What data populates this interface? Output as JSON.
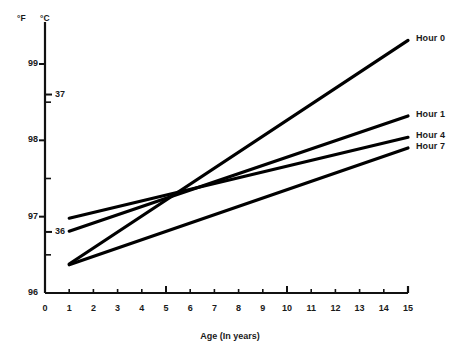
{
  "chart_data": {
    "type": "line",
    "title": "",
    "subtitle": "",
    "xlabel": "Age (In years)",
    "ylabel": "",
    "y_unit_primary": "°F",
    "y_unit_secondary": "°C",
    "xlim": [
      0,
      15
    ],
    "ylim": [
      96,
      99.6
    ],
    "grid": false,
    "legend_position": "right-inline",
    "x_ticks": [
      0,
      1,
      2,
      3,
      4,
      5,
      6,
      7,
      8,
      9,
      10,
      11,
      12,
      13,
      14,
      15
    ],
    "x_tick_labels": [
      "0",
      "1",
      "2",
      "3",
      "4",
      "5",
      "6",
      "7",
      "8",
      "9",
      "10",
      "11",
      "12",
      "13",
      "14",
      "15"
    ],
    "y_ticks_f_major": [
      96,
      97,
      98,
      99
    ],
    "y_tick_labels_f": [
      "96",
      "97",
      "98",
      "99"
    ],
    "y_ticks_f_minor": [
      96.5,
      97.5,
      98.5
    ],
    "y_ticks_c": [
      36,
      37
    ],
    "y_tick_labels_c": [
      "36",
      "37"
    ],
    "series": [
      {
        "name": "Hour 0",
        "label": "Hour 0",
        "x": [
          1,
          15
        ],
        "values": [
          96.38,
          99.31
        ],
        "color": "#000000"
      },
      {
        "name": "Hour 1",
        "label": "Hour 1",
        "x": [
          1,
          15
        ],
        "values": [
          96.81,
          98.32
        ],
        "color": "#000000"
      },
      {
        "name": "Hour 4",
        "label": "Hour 4",
        "x": [
          1,
          15
        ],
        "values": [
          96.98,
          98.04
        ],
        "color": "#000000"
      },
      {
        "name": "Hour 7",
        "label": "Hour 7",
        "x": [
          1,
          15
        ],
        "values": [
          96.37,
          97.9
        ],
        "color": "#000000"
      }
    ],
    "annotations": []
  },
  "axes": {
    "unit_f_label": "°F",
    "unit_c_label": "°C",
    "x_title": "Age (In years)"
  },
  "colors": {
    "line": "#000000",
    "axis": "#111111",
    "text": "#1a1a1a",
    "background": "#ffffff"
  }
}
